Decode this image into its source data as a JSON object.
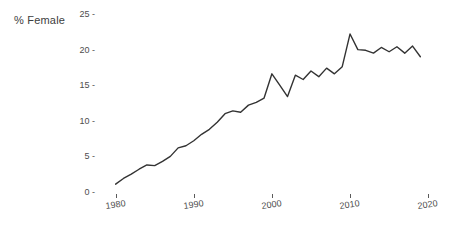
{
  "chart_data": {
    "type": "line",
    "title": "",
    "subtitle": "",
    "xlabel": "",
    "ylabel": "% Female",
    "xlim": [
      1978,
      2021
    ],
    "ylim": [
      0,
      25
    ],
    "grid": false,
    "legend": false,
    "legend_position": "none",
    "line_color": "#333333",
    "x_tick_labels": [
      "1980",
      "1990",
      "2000",
      "2010",
      "2020"
    ],
    "x_ticks": [
      1980,
      1990,
      2000,
      2010,
      2020
    ],
    "y_tick_labels": [
      "0",
      "5",
      "10",
      "15",
      "20",
      "25"
    ],
    "y_ticks": [
      0,
      5,
      10,
      15,
      20,
      25
    ],
    "series": [
      {
        "name": "% Female",
        "x": [
          1980,
          1981,
          1982,
          1983,
          1984,
          1985,
          1986,
          1987,
          1988,
          1989,
          1990,
          1991,
          1992,
          1993,
          1994,
          1995,
          1996,
          1997,
          1998,
          1999,
          2000,
          2001,
          2002,
          2003,
          2004,
          2005,
          2006,
          2007,
          2008,
          2009,
          2010,
          2011,
          2012,
          2013,
          2014,
          2015,
          2016,
          2017,
          2018,
          2019
        ],
        "values": [
          1.1,
          1.9,
          2.5,
          3.2,
          3.8,
          3.7,
          4.3,
          5.0,
          6.2,
          6.5,
          7.2,
          8.1,
          8.8,
          9.8,
          11.0,
          11.4,
          11.2,
          12.2,
          12.6,
          13.2,
          16.6,
          15.0,
          13.4,
          16.4,
          15.8,
          17.0,
          16.2,
          17.4,
          16.6,
          17.6,
          22.2,
          20.0,
          19.9,
          19.5,
          20.3,
          19.7,
          20.4,
          19.5,
          20.5,
          19.0
        ]
      }
    ]
  },
  "axis": {
    "y_title": "% Female",
    "tick_dash": "-",
    "tick_dot": "'"
  }
}
